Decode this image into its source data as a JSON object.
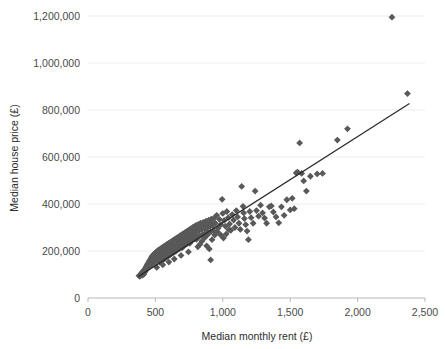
{
  "chart_data": {
    "type": "scatter",
    "title": "",
    "xlabel": "Median monthly rent (£)",
    "ylabel": "Median house price (£)",
    "xlim": [
      0,
      2500
    ],
    "ylim": [
      0,
      1250000
    ],
    "grid": true,
    "legend": "none",
    "marker": {
      "shape": "diamond",
      "color": "#595959",
      "size": 3.4
    },
    "xticks": [
      0,
      500,
      1000,
      1500,
      2000,
      2500
    ],
    "xticklabels": [
      "0",
      "500",
      "1,000",
      "1,500",
      "2,000",
      "2,500"
    ],
    "yticks": [
      0,
      200000,
      400000,
      600000,
      800000,
      1000000,
      1200000
    ],
    "yticklabels": [
      "0",
      "200,000",
      "400,000",
      "600,000",
      "800,000",
      "1,000,000",
      "1,200,000"
    ],
    "trendline": {
      "type": "linear",
      "color": "#2b2b2b",
      "x_start": 375,
      "y_start": 92000,
      "x_end": 2385,
      "y_end": 828000
    },
    "points": [
      [
        378,
        95000
      ],
      [
        385,
        92000
      ],
      [
        392,
        99000
      ],
      [
        398,
        104000
      ],
      [
        404,
        97000
      ],
      [
        410,
        108000
      ],
      [
        414,
        101000
      ],
      [
        418,
        118000
      ],
      [
        421,
        111000
      ],
      [
        425,
        126000
      ],
      [
        428,
        117000
      ],
      [
        432,
        133000
      ],
      [
        435,
        124000
      ],
      [
        438,
        140000
      ],
      [
        441,
        129000
      ],
      [
        444,
        146000
      ],
      [
        447,
        136000
      ],
      [
        450,
        152000
      ],
      [
        453,
        143000
      ],
      [
        456,
        158000
      ],
      [
        459,
        148000
      ],
      [
        462,
        163000
      ],
      [
        465,
        155000
      ],
      [
        468,
        170000
      ],
      [
        471,
        160000
      ],
      [
        474,
        176000
      ],
      [
        477,
        166000
      ],
      [
        480,
        181000
      ],
      [
        483,
        172000
      ],
      [
        486,
        158000
      ],
      [
        489,
        186000
      ],
      [
        492,
        176000
      ],
      [
        495,
        163000
      ],
      [
        498,
        191000
      ],
      [
        501,
        181000
      ],
      [
        504,
        168000
      ],
      [
        507,
        196000
      ],
      [
        510,
        186000
      ],
      [
        513,
        173000
      ],
      [
        516,
        200000
      ],
      [
        519,
        190000
      ],
      [
        522,
        178000
      ],
      [
        525,
        205000
      ],
      [
        528,
        194000
      ],
      [
        531,
        183000
      ],
      [
        534,
        152000
      ],
      [
        537,
        209000
      ],
      [
        540,
        198000
      ],
      [
        543,
        188000
      ],
      [
        546,
        158000
      ],
      [
        549,
        214000
      ],
      [
        552,
        203000
      ],
      [
        555,
        192000
      ],
      [
        558,
        163000
      ],
      [
        561,
        218000
      ],
      [
        564,
        207000
      ],
      [
        567,
        196000
      ],
      [
        570,
        168000
      ],
      [
        573,
        223000
      ],
      [
        576,
        211000
      ],
      [
        579,
        200000
      ],
      [
        582,
        173000
      ],
      [
        585,
        228000
      ],
      [
        588,
        216000
      ],
      [
        591,
        205000
      ],
      [
        594,
        178000
      ],
      [
        597,
        232000
      ],
      [
        600,
        220000
      ],
      [
        603,
        209000
      ],
      [
        606,
        183000
      ],
      [
        609,
        237000
      ],
      [
        612,
        225000
      ],
      [
        615,
        213000
      ],
      [
        618,
        188000
      ],
      [
        621,
        241000
      ],
      [
        624,
        229000
      ],
      [
        627,
        217000
      ],
      [
        630,
        192000
      ],
      [
        633,
        246000
      ],
      [
        636,
        234000
      ],
      [
        639,
        221000
      ],
      [
        642,
        197000
      ],
      [
        645,
        250000
      ],
      [
        648,
        238000
      ],
      [
        651,
        226000
      ],
      [
        654,
        201000
      ],
      [
        657,
        255000
      ],
      [
        660,
        242000
      ],
      [
        663,
        230000
      ],
      [
        666,
        206000
      ],
      [
        669,
        259000
      ],
      [
        672,
        247000
      ],
      [
        675,
        234000
      ],
      [
        678,
        210000
      ],
      [
        681,
        264000
      ],
      [
        684,
        251000
      ],
      [
        687,
        239000
      ],
      [
        690,
        215000
      ],
      [
        693,
        268000
      ],
      [
        696,
        255000
      ],
      [
        699,
        243000
      ],
      [
        702,
        219000
      ],
      [
        705,
        273000
      ],
      [
        708,
        260000
      ],
      [
        711,
        247000
      ],
      [
        714,
        224000
      ],
      [
        717,
        277000
      ],
      [
        720,
        264000
      ],
      [
        723,
        252000
      ],
      [
        726,
        228000
      ],
      [
        729,
        282000
      ],
      [
        732,
        268000
      ],
      [
        735,
        256000
      ],
      [
        738,
        233000
      ],
      [
        741,
        286000
      ],
      [
        744,
        273000
      ],
      [
        747,
        260000
      ],
      [
        750,
        237000
      ],
      [
        753,
        291000
      ],
      [
        756,
        277000
      ],
      [
        759,
        265000
      ],
      [
        762,
        242000
      ],
      [
        765,
        295000
      ],
      [
        768,
        282000
      ],
      [
        771,
        269000
      ],
      [
        774,
        246000
      ],
      [
        777,
        300000
      ],
      [
        780,
        286000
      ],
      [
        783,
        273000
      ],
      [
        786,
        251000
      ],
      [
        789,
        304000
      ],
      [
        792,
        290000
      ],
      [
        795,
        278000
      ],
      [
        798,
        255000
      ],
      [
        801,
        309000
      ],
      [
        805,
        295000
      ],
      [
        809,
        282000
      ],
      [
        813,
        260000
      ],
      [
        817,
        313000
      ],
      [
        821,
        299000
      ],
      [
        825,
        287000
      ],
      [
        830,
        264000
      ],
      [
        835,
        318000
      ],
      [
        840,
        303000
      ],
      [
        845,
        291000
      ],
      [
        850,
        269000
      ],
      [
        855,
        322000
      ],
      [
        860,
        308000
      ],
      [
        865,
        296000
      ],
      [
        870,
        273000
      ],
      [
        875,
        327000
      ],
      [
        880,
        312000
      ],
      [
        885,
        300000
      ],
      [
        890,
        278000
      ],
      [
        895,
        331000
      ],
      [
        900,
        316000
      ],
      [
        905,
        305000
      ],
      [
        910,
        282000
      ],
      [
        915,
        336000
      ],
      [
        920,
        321000
      ],
      [
        925,
        309000
      ],
      [
        930,
        287000
      ],
      [
        650,
        200000
      ],
      [
        700,
        215000
      ],
      [
        755,
        233000
      ],
      [
        805,
        250000
      ],
      [
        860,
        268000
      ],
      [
        610,
        186000
      ],
      [
        565,
        172000
      ],
      [
        520,
        160000
      ],
      [
        475,
        146000
      ],
      [
        430,
        131000
      ],
      [
        640,
        166000
      ],
      [
        690,
        181000
      ],
      [
        745,
        196000
      ],
      [
        600,
        153000
      ],
      [
        555,
        141000
      ],
      [
        510,
        130000
      ],
      [
        880,
        222000
      ],
      [
        900,
        209000
      ],
      [
        910,
        162000
      ],
      [
        935,
        340000
      ],
      [
        945,
        318000
      ],
      [
        955,
        352000
      ],
      [
        965,
        297000
      ],
      [
        975,
        335000
      ],
      [
        985,
        312000
      ],
      [
        995,
        420000
      ],
      [
        1000,
        360000
      ],
      [
        1010,
        330000
      ],
      [
        1020,
        305000
      ],
      [
        1030,
        368000
      ],
      [
        1040,
        342000
      ],
      [
        1050,
        315000
      ],
      [
        1060,
        288000
      ],
      [
        1070,
        355000
      ],
      [
        1080,
        332000
      ],
      [
        1090,
        300000
      ],
      [
        1100,
        372000
      ],
      [
        1110,
        345000
      ],
      [
        1120,
        318000
      ],
      [
        1130,
        292000
      ],
      [
        1140,
        475000
      ],
      [
        1150,
        390000
      ],
      [
        1155,
        362000
      ],
      [
        1160,
        338000
      ],
      [
        1170,
        312000
      ],
      [
        1180,
        285000
      ],
      [
        1190,
        248000
      ],
      [
        1200,
        368000
      ],
      [
        1210,
        342000
      ],
      [
        1225,
        318000
      ],
      [
        1240,
        455000
      ],
      [
        1250,
        372000
      ],
      [
        1265,
        348000
      ],
      [
        1280,
        395000
      ],
      [
        1295,
        362000
      ],
      [
        1310,
        340000
      ],
      [
        1325,
        318000
      ],
      [
        1345,
        388000
      ],
      [
        1360,
        392000
      ],
      [
        1375,
        366000
      ],
      [
        1395,
        345000
      ],
      [
        1415,
        320000
      ],
      [
        1435,
        388000
      ],
      [
        1455,
        352000
      ],
      [
        1475,
        418000
      ],
      [
        1500,
        375000
      ],
      [
        1515,
        424000
      ],
      [
        1530,
        380000
      ],
      [
        1545,
        532000
      ],
      [
        1555,
        536000
      ],
      [
        1570,
        660000
      ],
      [
        1585,
        530000
      ],
      [
        1600,
        498000
      ],
      [
        1620,
        455000
      ],
      [
        1650,
        518000
      ],
      [
        1700,
        528000
      ],
      [
        1740,
        530000
      ],
      [
        1850,
        672000
      ],
      [
        1925,
        720000
      ],
      [
        2255,
        1195000
      ],
      [
        2370,
        870000
      ],
      [
        845,
        242000
      ],
      [
        865,
        256000
      ],
      [
        885,
        268000
      ],
      [
        830,
        228000
      ],
      [
        815,
        218000
      ],
      [
        870,
        292000
      ],
      [
        895,
        320000
      ],
      [
        920,
        248000
      ],
      [
        940,
        268000
      ],
      [
        960,
        282000
      ],
      [
        985,
        268000
      ],
      [
        1005,
        255000
      ],
      [
        1025,
        272000
      ],
      [
        1045,
        290000
      ],
      [
        585,
        195000
      ],
      [
        605,
        203000
      ],
      [
        625,
        211000
      ],
      [
        645,
        219000
      ],
      [
        665,
        227000
      ],
      [
        685,
        235000
      ],
      [
        705,
        243000
      ],
      [
        725,
        251000
      ],
      [
        745,
        259000
      ],
      [
        495,
        152000
      ],
      [
        515,
        160000
      ],
      [
        535,
        168000
      ],
      [
        555,
        176000
      ],
      [
        575,
        184000
      ],
      [
        455,
        136000
      ],
      [
        470,
        142000
      ],
      [
        440,
        128000
      ],
      [
        415,
        118000
      ],
      [
        400,
        110000
      ]
    ]
  }
}
